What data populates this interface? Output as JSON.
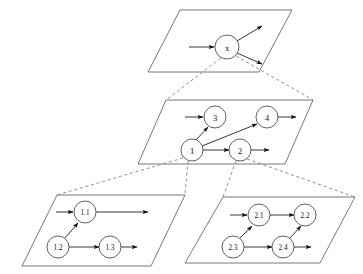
{
  "diagram": {
    "type": "layered-statechart",
    "colors": {
      "background": "#ffffff",
      "plane_stroke": "#555555",
      "node_stroke": "#444444",
      "node_fill": "#ffffff",
      "arrow": "#111111",
      "dashed_connector": "#777777",
      "label": "#111111"
    },
    "planes": [
      {
        "id": "plane-top",
        "name": "top-level-plane",
        "corners": [
          [
            180,
            10
          ],
          [
            292,
            10
          ],
          [
            259,
            72
          ],
          [
            148,
            72
          ]
        ],
        "nodes": [
          {
            "id": "x",
            "label": "x",
            "cx": 227,
            "cy": 47,
            "r": 12
          }
        ],
        "edges": [
          {
            "from": "external-left",
            "to": "x",
            "x1": 189,
            "y1": 47,
            "x2": 214,
            "y2": 47,
            "kind": "incoming"
          },
          {
            "from": "x",
            "to": "external-upper-right",
            "x1": 237,
            "y1": 41,
            "x2": 262,
            "y2": 26,
            "kind": "outgoing"
          },
          {
            "from": "x",
            "to": "external-lower-right",
            "x1": 237,
            "y1": 53,
            "x2": 262,
            "y2": 64,
            "kind": "outgoing"
          }
        ]
      },
      {
        "id": "plane-middle",
        "name": "middle-level-plane",
        "corners": [
          [
            166,
            100
          ],
          [
            313,
            100
          ],
          [
            285,
            164
          ],
          [
            138,
            164
          ]
        ],
        "nodes": [
          {
            "id": "3",
            "label": "3",
            "cx": 215,
            "cy": 117,
            "r": 11
          },
          {
            "id": "4",
            "label": "4",
            "cx": 267,
            "cy": 117,
            "r": 11
          },
          {
            "id": "1",
            "label": "1",
            "cx": 192,
            "cy": 150,
            "r": 11
          },
          {
            "id": "2",
            "label": "2",
            "cx": 240,
            "cy": 150,
            "r": 11
          }
        ],
        "edges": [
          {
            "from": "external-left",
            "to": "3",
            "x1": 185,
            "y1": 117,
            "x2": 203,
            "y2": 117,
            "kind": "incoming"
          },
          {
            "from": "1",
            "to": "3",
            "x1": 196,
            "y1": 140,
            "x2": 208,
            "y2": 127,
            "kind": "internal"
          },
          {
            "from": "1",
            "to": "4",
            "x1": 202,
            "y1": 146,
            "x2": 257,
            "y2": 124,
            "kind": "internal"
          },
          {
            "from": "1",
            "to": "2",
            "x1": 203,
            "y1": 150,
            "x2": 229,
            "y2": 150,
            "kind": "internal"
          },
          {
            "from": "2",
            "to": "external-right",
            "x1": 251,
            "y1": 150,
            "x2": 269,
            "y2": 150,
            "kind": "outgoing"
          },
          {
            "from": "4",
            "to": "external-right",
            "x1": 278,
            "y1": 117,
            "x2": 296,
            "y2": 117,
            "kind": "outgoing"
          }
        ]
      },
      {
        "id": "plane-bottom-left",
        "name": "bottom-left-plane",
        "corners": [
          [
            57,
            195
          ],
          [
            185,
            195
          ],
          [
            151,
            266
          ],
          [
            22,
            266
          ]
        ],
        "nodes": [
          {
            "id": "1.1",
            "label": "1.1",
            "cx": 85,
            "cy": 212,
            "r": 11
          },
          {
            "id": "1.2",
            "label": "1.2",
            "cx": 58,
            "cy": 247,
            "r": 11
          },
          {
            "id": "1.3",
            "label": "1.3",
            "cx": 110,
            "cy": 247,
            "r": 11
          }
        ],
        "edges": [
          {
            "from": "external-left",
            "to": "1.1",
            "x1": 56,
            "y1": 212,
            "x2": 73,
            "y2": 212,
            "kind": "incoming"
          },
          {
            "from": "1.1",
            "to": "external-right",
            "x1": 96,
            "y1": 212,
            "x2": 148,
            "y2": 212,
            "kind": "outgoing"
          },
          {
            "from": "1.2",
            "to": "1.1",
            "x1": 65,
            "y1": 238,
            "x2": 78,
            "y2": 223,
            "kind": "internal"
          },
          {
            "from": "1.2",
            "to": "1.3",
            "x1": 69,
            "y1": 247,
            "x2": 99,
            "y2": 247,
            "kind": "internal"
          },
          {
            "from": "1.3",
            "to": "external-right",
            "x1": 121,
            "y1": 247,
            "x2": 137,
            "y2": 247,
            "kind": "outgoing"
          }
        ]
      },
      {
        "id": "plane-bottom-right",
        "name": "bottom-right-plane",
        "corners": [
          [
            223,
            197
          ],
          [
            355,
            197
          ],
          [
            320,
            263
          ],
          [
            185,
            263
          ]
        ],
        "nodes": [
          {
            "id": "2.1",
            "label": "2.1",
            "cx": 259,
            "cy": 215,
            "r": 11
          },
          {
            "id": "2.2",
            "label": "2.2",
            "cx": 305,
            "cy": 215,
            "r": 11
          },
          {
            "id": "2.3",
            "label": "2.3",
            "cx": 233,
            "cy": 247,
            "r": 11
          },
          {
            "id": "2.4",
            "label": "2.4",
            "cx": 283,
            "cy": 247,
            "r": 11
          }
        ],
        "edges": [
          {
            "from": "external-left",
            "to": "2.1",
            "x1": 230,
            "y1": 215,
            "x2": 247,
            "y2": 215,
            "kind": "incoming"
          },
          {
            "from": "2.1",
            "to": "2.2",
            "x1": 270,
            "y1": 215,
            "x2": 294,
            "y2": 215,
            "kind": "internal"
          },
          {
            "from": "2.3",
            "to": "2.1",
            "x1": 240,
            "y1": 238,
            "x2": 252,
            "y2": 226,
            "kind": "internal"
          },
          {
            "from": "2.3",
            "to": "2.4",
            "x1": 244,
            "y1": 247,
            "x2": 272,
            "y2": 247,
            "kind": "internal"
          },
          {
            "from": "2.4",
            "to": "2.2",
            "x1": 290,
            "y1": 238,
            "x2": 301,
            "y2": 226,
            "kind": "internal"
          },
          {
            "from": "2.4",
            "to": "external-right",
            "x1": 294,
            "y1": 247,
            "x2": 311,
            "y2": 247,
            "kind": "outgoing"
          }
        ]
      }
    ],
    "refinement_links": [
      {
        "name": "x-to-middle-left",
        "x1": 221,
        "y1": 58,
        "x2": 166,
        "y2": 100
      },
      {
        "name": "x-to-middle-right",
        "x1": 236,
        "y1": 56,
        "x2": 313,
        "y2": 100
      },
      {
        "name": "node1-to-bottom-left-top",
        "x1": 188,
        "y1": 161,
        "x2": 185,
        "y2": 195
      },
      {
        "name": "node1-to-bottom-left-side",
        "x1": 183,
        "y1": 158,
        "x2": 57,
        "y2": 195
      },
      {
        "name": "node2-to-bottom-right-top",
        "x1": 236,
        "y1": 161,
        "x2": 223,
        "y2": 197
      },
      {
        "name": "node2-to-bottom-right-side",
        "x1": 247,
        "y1": 159,
        "x2": 355,
        "y2": 197
      }
    ]
  }
}
